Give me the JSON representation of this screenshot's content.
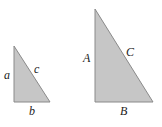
{
  "diagram": {
    "colors": {
      "fill": "#c6c6c6",
      "stroke": "#8a8a8a",
      "text": "#222222"
    },
    "small_triangle": {
      "labels": {
        "vertical_side": "a",
        "hypotenuse": "c",
        "base": "b"
      }
    },
    "large_triangle": {
      "labels": {
        "vertical_side": "A",
        "hypotenuse": "C",
        "base": "B"
      }
    }
  }
}
